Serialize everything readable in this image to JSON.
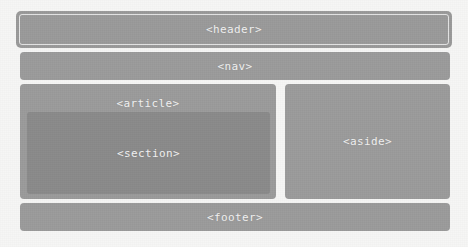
{
  "diagram": {
    "background_color": "#f6f6f5",
    "label_color": "#f2f2f2",
    "boxes": {
      "header": {
        "label": "<header>",
        "color": "#9a9a9a",
        "inner_outline": true
      },
      "nav": {
        "label": "<nav>",
        "color": "#9b9b9b",
        "inner_outline": false
      },
      "article": {
        "label": "<article>",
        "color": "#9b9b9b",
        "inner_outline": false
      },
      "section": {
        "label": "<section>",
        "color": "#8a8a8a",
        "inner_outline": false
      },
      "aside": {
        "label": "<aside>",
        "color": "#9b9b9b",
        "inner_outline": false
      },
      "footer": {
        "label": "<footer>",
        "color": "#9b9b9b",
        "inner_outline": false
      }
    }
  }
}
